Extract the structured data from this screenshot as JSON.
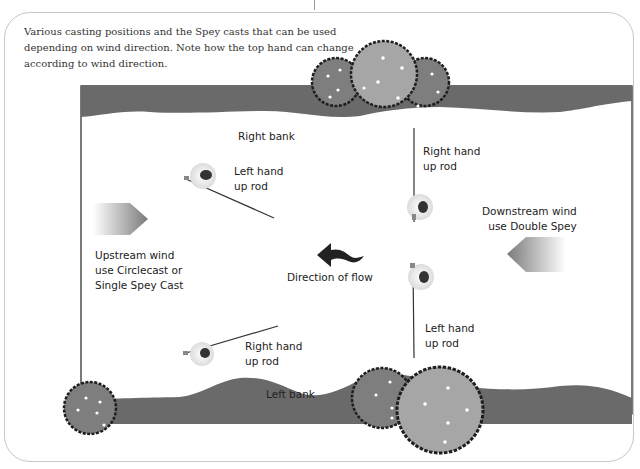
{
  "caption": "Various casting positions and the Spey casts that can be used depending on wind direction. Note how the top hand can change according to wind direction.",
  "labels": {
    "right_bank": "Right bank",
    "left_bank": "Left bank",
    "caster_top_left": "Left hand\nup rod",
    "caster_top_right": "Right hand\nup rod",
    "caster_bottom_left": "Right hand\nup rod",
    "caster_bottom_right": "Left hand\nup rod",
    "upstream_wind": "Upstream wind\nuse Circlecast or\nSingle Spey Cast",
    "downstream_wind": "Downstream wind\nuse Double Spey",
    "flow": "Direction of flow"
  },
  "icons": {
    "tree": "tree-icon",
    "angler": "angler-icon",
    "wind_arrow": "wind-arrow-icon",
    "flow_arrow": "flow-arrow-icon"
  },
  "colors": {
    "bank": "#6a6a6a",
    "tree_dark": "#7e7e7e",
    "tree_light": "#a6a6a6",
    "tree_outline": "#1e1e1e",
    "text": "#222222"
  }
}
